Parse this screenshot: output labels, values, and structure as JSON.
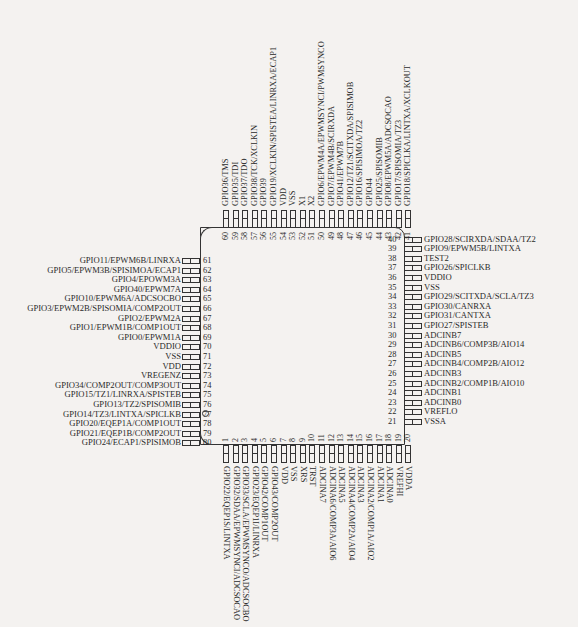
{
  "diagram": {
    "type": "pinout",
    "package": "80-pin QFP",
    "pin1_marker": "circle"
  },
  "pins": {
    "bottom": [
      {
        "n": "1",
        "label": "GPIO22/EQEP1S/LINTXA"
      },
      {
        "n": "2",
        "label": "GPIO32/SDAA/EPWMSYNCI/ADCSOCAO"
      },
      {
        "n": "3",
        "label": "GPIO33/SCLA/EPWMSYNCO/ADCSOCBO"
      },
      {
        "n": "4",
        "label": "GPIO23/EQEP1I/LINRXA"
      },
      {
        "n": "5",
        "label": "GPIO42/COMP1OUT"
      },
      {
        "n": "6",
        "label": "GPIO43/COMP2OUT"
      },
      {
        "n": "7",
        "label": "VDD"
      },
      {
        "n": "8",
        "label": "VSS"
      },
      {
        "n": "9",
        "label": "XRS"
      },
      {
        "n": "10",
        "label": "TRST"
      },
      {
        "n": "11",
        "label": "ADCINA7"
      },
      {
        "n": "12",
        "label": "ADCINA6/COMP3A/AIO6"
      },
      {
        "n": "13",
        "label": "ADCINA5"
      },
      {
        "n": "14",
        "label": "ADCINA4/COMP2A/AIO4"
      },
      {
        "n": "15",
        "label": "ADCINA3"
      },
      {
        "n": "16",
        "label": "ADCINA2/COMP1A/AIO2"
      },
      {
        "n": "17",
        "label": "ADCINA1"
      },
      {
        "n": "18",
        "label": "ADCINA0"
      },
      {
        "n": "19",
        "label": "VREFHI"
      },
      {
        "n": "20",
        "label": "VDDA"
      }
    ],
    "right": [
      {
        "n": "21",
        "label": "VSSA"
      },
      {
        "n": "22",
        "label": "VREFLO"
      },
      {
        "n": "23",
        "label": "ADCINB0"
      },
      {
        "n": "24",
        "label": "ADCINB1"
      },
      {
        "n": "25",
        "label": "ADCINB2/COMP1B/AIO10"
      },
      {
        "n": "26",
        "label": "ADCINB3"
      },
      {
        "n": "27",
        "label": "ADCINB4/COMP2B/AIO12"
      },
      {
        "n": "28",
        "label": "ADCINB5"
      },
      {
        "n": "29",
        "label": "ADCINB6/COMP3B/AIO14"
      },
      {
        "n": "30",
        "label": "ADCINB7"
      },
      {
        "n": "31",
        "label": "GPIO27/SPISTEB"
      },
      {
        "n": "32",
        "label": "GPIO31/CANTXA"
      },
      {
        "n": "33",
        "label": "GPIO30/CANRXA"
      },
      {
        "n": "34",
        "label": "GPIO29/SCITXDA/SCLA/TZ3"
      },
      {
        "n": "35",
        "label": "VSS"
      },
      {
        "n": "36",
        "label": "VDDIO"
      },
      {
        "n": "37",
        "label": "GPIO26/SPICLKB"
      },
      {
        "n": "38",
        "label": "TEST2"
      },
      {
        "n": "39",
        "label": "GPIO9/EPWM5B/LINTXA"
      },
      {
        "n": "40",
        "label": "GPIO28/SCIRXDA/SDAA/TZ2"
      }
    ],
    "top": [
      {
        "n": "41",
        "label": "GPIO18/SPICLKA/LINTXA/XCLKOUT"
      },
      {
        "n": "42",
        "label": "GPIO17/SPISOMIA/TZ3"
      },
      {
        "n": "43",
        "label": "GPIO8/EPWM5A/ADCSOCAO"
      },
      {
        "n": "44",
        "label": "GPIO25/SPISOMIB"
      },
      {
        "n": "45",
        "label": "GPIO44"
      },
      {
        "n": "46",
        "label": "GPIO16/SPISIMOA/TZ2"
      },
      {
        "n": "47",
        "label": "GPIO12/TZ1/SCITXDA/SPISIMOB"
      },
      {
        "n": "48",
        "label": "GPIO41/EPWM7B"
      },
      {
        "n": "49",
        "label": "GPIO7/EPWM4B/SCIRXDA"
      },
      {
        "n": "50",
        "label": "GPIO6/EPWM4A/EPWMSYNCI/PWMSYNCO"
      },
      {
        "n": "51",
        "label": "X2"
      },
      {
        "n": "52",
        "label": "X1"
      },
      {
        "n": "53",
        "label": "VSS"
      },
      {
        "n": "54",
        "label": "VDD"
      },
      {
        "n": "55",
        "label": "GPIO19/XCLKIN/SPISTEA/LINRXA/ECAP1"
      },
      {
        "n": "56",
        "label": "GPIO39"
      },
      {
        "n": "57",
        "label": "GPIO38/TCK/XCLKIN"
      },
      {
        "n": "58",
        "label": "GPIO37/TDO"
      },
      {
        "n": "59",
        "label": "GPIO35/TDI"
      },
      {
        "n": "60",
        "label": "GPIO36/TMS"
      }
    ],
    "left": [
      {
        "n": "61",
        "label": "GPIO11/EPWM6B/LINRXA"
      },
      {
        "n": "62",
        "label": "GPIO5/EPWM3B/SPISIMOA/ECAP1"
      },
      {
        "n": "63",
        "label": "GPIO4/EPOWM3A"
      },
      {
        "n": "64",
        "label": "GPIO40/EPWM7A"
      },
      {
        "n": "65",
        "label": "GPIO10/EPWM6A/ADCSOCBO"
      },
      {
        "n": "66",
        "label": "GPIO3/EPWM2B/SPISOMIA/COMP2OUT"
      },
      {
        "n": "67",
        "label": "GPIO2/EPWM2A"
      },
      {
        "n": "68",
        "label": "GPIO1/EPWM1B/COMP1OUT"
      },
      {
        "n": "69",
        "label": "GPIO0/EPWM1A"
      },
      {
        "n": "70",
        "label": "VDDIO"
      },
      {
        "n": "71",
        "label": "VSS"
      },
      {
        "n": "72",
        "label": "VDD"
      },
      {
        "n": "73",
        "label": "VREGENZ"
      },
      {
        "n": "74",
        "label": "GPIO34/COMP2OUT/COMP3OUT"
      },
      {
        "n": "75",
        "label": "GPIO15/TZ1/LINRXA/SPISTEB"
      },
      {
        "n": "76",
        "label": "GPIO13/TZ2/SPISOMIB"
      },
      {
        "n": "77",
        "label": "GPIO14/TZ3/LINTXA/SPICLKB"
      },
      {
        "n": "78",
        "label": "GPIO20/EQEP1A/COMP1OUT"
      },
      {
        "n": "79",
        "label": "GPIO21/EQEP1B/COMP2OUT"
      },
      {
        "n": "80",
        "label": "GPIO24/ECAP1/SPISIMOB"
      }
    ]
  },
  "colors": {
    "background": "#f4f2f0",
    "ink": "#2a2a2a"
  }
}
